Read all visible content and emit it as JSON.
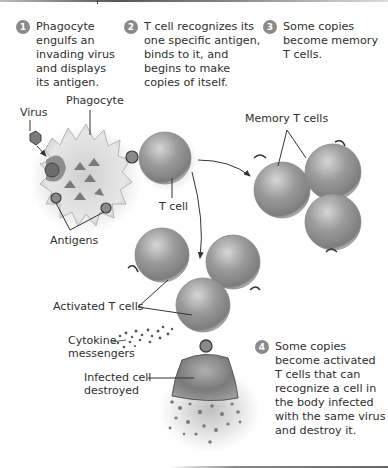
{
  "steps": [
    {
      "number": "1",
      "text": "Phagocyte\nengulfs an\ninvading virus\nand displays\nits antigen."
    },
    {
      "number": "2",
      "text": "T cell recognizes its\none specific antigen,\nbinds to it, and\nbegins to make\ncopies of itself."
    },
    {
      "number": "3",
      "text": "Some copies\nbecome memory\nT cells."
    },
    {
      "number": "4",
      "text": "Some copies\nbecome activated\nT cells that can\nrecognize a cell in\nthe body infected\nwith the same virus\nand destroy it."
    }
  ],
  "labels": {
    "virus": "Virus",
    "phagocyte": "Phagocyte",
    "t_cell": "T cell",
    "antigens": "Antigens",
    "memory_t_cells": "Memory T cells",
    "activated_t_cells": "Activated T cells",
    "cytokine_messengers": "Cytokine\nmessengers",
    "infected_cell": "Infected cell\ndestroyed"
  },
  "colors": {
    "step_badge": "#8a8a8a",
    "cell_fill": "#9a9a9a",
    "text": "#2e2e2e"
  }
}
